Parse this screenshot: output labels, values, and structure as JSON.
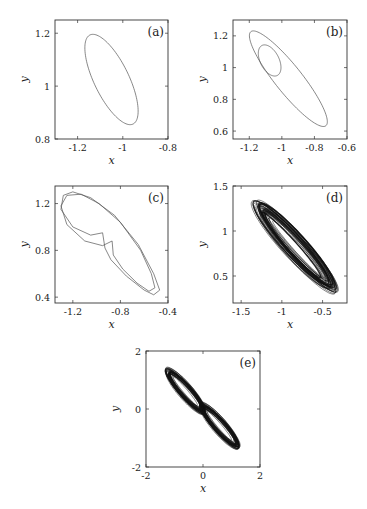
{
  "chart_data": [
    {
      "id": "a",
      "label": "(a)",
      "type": "line",
      "title": "",
      "xlabel": "x",
      "ylabel": "y",
      "xlim": [
        -1.3,
        -0.8
      ],
      "ylim": [
        0.8,
        1.25
      ],
      "xticks": [
        -1.2,
        -1,
        -0.8
      ],
      "xtick_labels": [
        "-1.2",
        "-1",
        "-0.8"
      ],
      "yticks": [
        0.8,
        1,
        1.2
      ],
      "ytick_labels": [
        "0.8",
        "1",
        "1.2"
      ],
      "grid": false,
      "description": "period-1 limit cycle: single tilted ellipse",
      "series": [
        {
          "name": "orbit",
          "kind": "ellipse",
          "cx": -1.05,
          "cy": 1.025,
          "rx": 0.21,
          "ry": 0.07,
          "angle_deg": -63,
          "stroke": "#555555",
          "width": 0.7
        }
      ]
    },
    {
      "id": "b",
      "label": "(b)",
      "type": "line",
      "title": "",
      "xlabel": "x",
      "ylabel": "y",
      "xlim": [
        -1.3,
        -0.6
      ],
      "ylim": [
        0.55,
        1.3
      ],
      "xticks": [
        -1.2,
        -1,
        -0.8,
        -0.6
      ],
      "xtick_labels": [
        "-1.2",
        "-1",
        "-0.8",
        "-0.6"
      ],
      "yticks": [
        0.6,
        0.8,
        1,
        1.2
      ],
      "ytick_labels": [
        "0.6",
        "0.8",
        "1",
        "1.2"
      ],
      "grid": false,
      "description": "period-2 limit cycle: large tilted loop with inner small loop",
      "series": [
        {
          "name": "outer-loop",
          "kind": "ellipse",
          "cx": -0.96,
          "cy": 0.93,
          "rx": 0.36,
          "ry": 0.085,
          "angle_deg": -50,
          "stroke": "#555555",
          "width": 0.7
        },
        {
          "name": "inner-loop",
          "kind": "ellipse",
          "cx": -1.075,
          "cy": 1.045,
          "rx": 0.1,
          "ry": 0.06,
          "angle_deg": -60,
          "stroke": "#555555",
          "width": 0.7
        }
      ]
    },
    {
      "id": "c",
      "label": "(c)",
      "type": "line",
      "title": "",
      "xlabel": "x",
      "ylabel": "y",
      "xlim": [
        -1.35,
        -0.4
      ],
      "ylim": [
        0.35,
        1.35
      ],
      "xticks": [
        -1.2,
        -0.8,
        -0.4
      ],
      "xtick_labels": [
        "-1.2",
        "-0.8",
        "-0.4"
      ],
      "yticks": [
        0.4,
        0.8,
        1.2
      ],
      "ytick_labels": [
        "0.4",
        "0.8",
        "1.2"
      ],
      "grid": false,
      "description": "period-4 / higher-period orbit with cusps near (-0.95, 0.95) and (-0.87, 0.88)",
      "series": [
        {
          "name": "orbit-1",
          "kind": "path",
          "points": [
            [
              -0.95,
              0.95
            ],
            [
              -1.05,
              0.93
            ],
            [
              -1.2,
              1.0
            ],
            [
              -1.3,
              1.15
            ],
            [
              -1.28,
              1.27
            ],
            [
              -1.2,
              1.3
            ],
            [
              -1.05,
              1.25
            ],
            [
              -0.85,
              1.1
            ],
            [
              -0.65,
              0.85
            ],
            [
              -0.52,
              0.6
            ],
            [
              -0.47,
              0.46
            ],
            [
              -0.52,
              0.42
            ],
            [
              -0.6,
              0.46
            ],
            [
              -0.75,
              0.58
            ],
            [
              -0.88,
              0.72
            ],
            [
              -0.93,
              0.82
            ],
            [
              -0.95,
              0.95
            ]
          ],
          "stroke": "#555555",
          "width": 0.7
        },
        {
          "name": "orbit-2",
          "kind": "path",
          "points": [
            [
              -0.87,
              0.88
            ],
            [
              -0.95,
              0.84
            ],
            [
              -1.1,
              0.88
            ],
            [
              -1.25,
              1.02
            ],
            [
              -1.3,
              1.18
            ],
            [
              -1.25,
              1.27
            ],
            [
              -1.13,
              1.28
            ],
            [
              -0.98,
              1.2
            ],
            [
              -0.8,
              1.04
            ],
            [
              -0.63,
              0.8
            ],
            [
              -0.54,
              0.6
            ],
            [
              -0.51,
              0.48
            ],
            [
              -0.56,
              0.45
            ],
            [
              -0.66,
              0.52
            ],
            [
              -0.78,
              0.64
            ],
            [
              -0.86,
              0.76
            ],
            [
              -0.87,
              0.88
            ]
          ],
          "stroke": "#555555",
          "width": 0.7
        }
      ]
    },
    {
      "id": "d",
      "label": "(d)",
      "type": "line",
      "title": "",
      "xlabel": "x",
      "ylabel": "y",
      "xlim": [
        -1.6,
        -0.2
      ],
      "ylim": [
        0.2,
        1.5
      ],
      "xticks": [
        -1.5,
        -1,
        -0.5
      ],
      "xtick_labels": [
        "-1.5",
        "-1",
        "-0.5"
      ],
      "yticks": [
        0.5,
        1,
        1.5
      ],
      "ytick_labels": [
        "0.5",
        "1",
        "1.5"
      ],
      "grid": false,
      "description": "chaotic attractor: dense band of spiraling orbits, x in [-1.3,-0.35], y in [0.35,1.3]",
      "series": [
        {
          "name": "attractor",
          "kind": "dense-band",
          "cx": -0.83,
          "cy": 0.82,
          "rx": 0.68,
          "ry": 0.12,
          "angle_deg": -45,
          "loops": 40,
          "stroke": "#111111",
          "width": 0.6
        }
      ]
    },
    {
      "id": "e",
      "label": "(e)",
      "type": "line",
      "title": "",
      "xlabel": "x",
      "ylabel": "y",
      "xlim": [
        -2,
        2
      ],
      "ylim": [
        -2,
        2
      ],
      "xticks": [
        -2,
        0,
        2
      ],
      "xtick_labels": [
        "-2",
        "0",
        "2"
      ],
      "yticks": [
        -2,
        0,
        2
      ],
      "ytick_labels": [
        "-2",
        "0",
        "2"
      ],
      "grid": false,
      "description": "double-scroll chaotic attractor symmetric about origin, x in [-1.4,1.4], y in [-1.4,1.4]",
      "series": [
        {
          "name": "lobe-upper-left",
          "kind": "dense-band",
          "cx": -0.6,
          "cy": 0.6,
          "rx": 1.0,
          "ry": 0.22,
          "angle_deg": -48,
          "loops": 30,
          "stroke": "#111111",
          "width": 0.6
        },
        {
          "name": "lobe-lower-right",
          "kind": "dense-band",
          "cx": 0.6,
          "cy": -0.6,
          "rx": 1.0,
          "ry": 0.22,
          "angle_deg": -48,
          "loops": 30,
          "stroke": "#111111",
          "width": 0.6
        }
      ]
    }
  ],
  "layout": {
    "panels": [
      {
        "id": "a",
        "frame": [
          55,
          20,
          113,
          119
        ]
      },
      {
        "id": "b",
        "frame": [
          233,
          20,
          114,
          119
        ]
      },
      {
        "id": "c",
        "frame": [
          55,
          186,
          113,
          117
        ]
      },
      {
        "id": "d",
        "frame": [
          233,
          186,
          114,
          117
        ]
      },
      {
        "id": "e",
        "frame": [
          146,
          351,
          114,
          116
        ]
      }
    ]
  }
}
